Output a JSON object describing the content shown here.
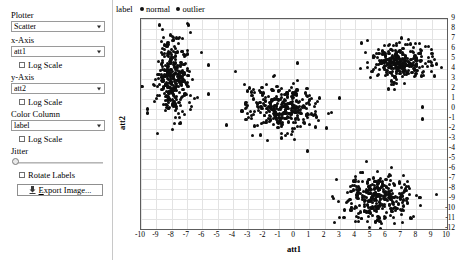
{
  "sidebar": {
    "plotter": {
      "label": "Plotter",
      "value": "Scatter",
      "options": [
        "Scatter"
      ]
    },
    "x_axis": {
      "label": "x-Axis",
      "value": "att1",
      "log_scale_label": "Log Scale",
      "log_scale_checked": false
    },
    "y_axis": {
      "label": "y-Axis",
      "value": "att2",
      "log_scale_label": "Log Scale",
      "log_scale_checked": false
    },
    "color_column": {
      "label": "Color Column",
      "value": "label",
      "log_scale_label": "Log Scale",
      "log_scale_checked": false
    },
    "jitter": {
      "label": "Jitter",
      "value": 0
    },
    "rotate_labels": {
      "label": "Rotate Labels",
      "checked": false
    },
    "export_button": {
      "label": "Export Image...",
      "mnemonic": "E",
      "icon": "export-image-icon"
    }
  },
  "legend": {
    "title": "label",
    "items": [
      {
        "label": "normal",
        "color": "#111111"
      },
      {
        "label": "outlier",
        "color": "#111111"
      }
    ]
  },
  "chart_data": {
    "type": "scatter",
    "title": "",
    "xlabel": "att1",
    "ylabel": "att2",
    "xlim": [
      -10,
      10
    ],
    "ylim": [
      -12,
      9
    ],
    "xticks": [
      -10,
      -9,
      -8,
      -7,
      -6,
      -5,
      -4,
      -3,
      -2,
      -1,
      0,
      1,
      2,
      3,
      4,
      5,
      6,
      7,
      8,
      9,
      10
    ],
    "yticks": [
      9,
      8,
      7,
      6,
      5,
      4,
      3,
      2,
      1,
      0,
      -1,
      -2,
      -3,
      -4,
      -5,
      -6,
      -7,
      -8,
      -9,
      -10,
      -11,
      -12
    ],
    "grid": true,
    "legend_position": "top-left",
    "point_color": "#0d0d0d",
    "point_size": 3,
    "clusters": [
      {
        "name": "left-cluster",
        "cx": -7.9,
        "cy": 3.1,
        "sx": 0.52,
        "sy": 2.05,
        "n": 320
      },
      {
        "name": "middle-cluster",
        "cx": -0.7,
        "cy": 0.1,
        "sx": 1.05,
        "sy": 1.15,
        "n": 320
      },
      {
        "name": "right-cluster",
        "cx": 6.9,
        "cy": 4.7,
        "sx": 0.95,
        "sy": 0.95,
        "n": 300
      },
      {
        "name": "bottom-cluster",
        "cx": 5.6,
        "cy": -8.9,
        "sx": 1.1,
        "sy": 1.25,
        "n": 330
      }
    ],
    "outliers": [
      {
        "x": -8.8,
        "y": 8.4
      },
      {
        "x": -6.9,
        "y": 8.4
      },
      {
        "x": -5.6,
        "y": 4.4
      },
      {
        "x": -5.6,
        "y": 1.5
      },
      {
        "x": -4.4,
        "y": -1.6
      },
      {
        "x": -3.4,
        "y": -0.2
      },
      {
        "x": -2.2,
        "y": -2.6
      },
      {
        "x": 0.2,
        "y": 4.6
      },
      {
        "x": 1.4,
        "y": -1.8
      },
      {
        "x": 2.1,
        "y": -1.9
      },
      {
        "x": 3.0,
        "y": 1.1
      },
      {
        "x": 4.4,
        "y": 6.6
      },
      {
        "x": 8.4,
        "y": 0.2
      },
      {
        "x": 8.4,
        "y": -1.0
      },
      {
        "x": 9.3,
        "y": 4.5
      },
      {
        "x": -9.6,
        "y": 0.0
      },
      {
        "x": -9.6,
        "y": -0.4
      },
      {
        "x": 6.4,
        "y": 2.8
      },
      {
        "x": 7.9,
        "y": 4.0
      },
      {
        "x": 0.9,
        "y": -4.2
      }
    ]
  }
}
